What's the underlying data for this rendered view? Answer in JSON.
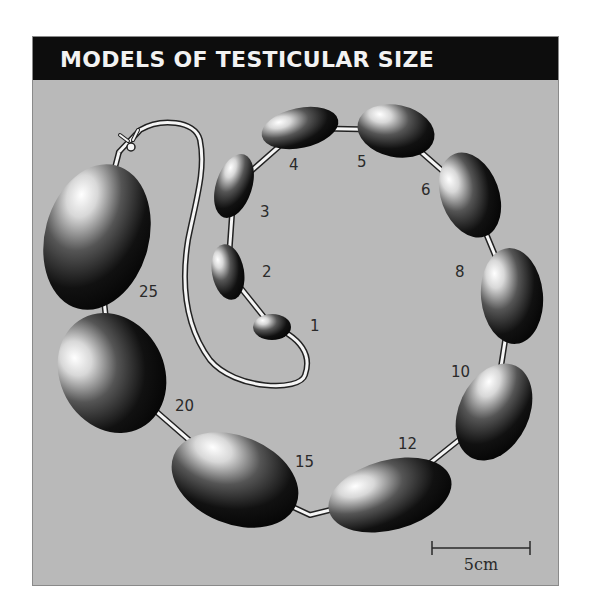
{
  "title": "MODELS OF TESTICULAR SIZE",
  "colors": {
    "background": "#b9b9b9",
    "header": "#0d0d0d",
    "title_text": "#f2f2f2",
    "bead_dark": "#0a0a0a",
    "bead_highlight": "#ffffff",
    "string": "#f5f5f5",
    "label_text": "#2a2a2a"
  },
  "beads": [
    {
      "label": "1",
      "volume_ml": 1
    },
    {
      "label": "2",
      "volume_ml": 2
    },
    {
      "label": "3",
      "volume_ml": 3
    },
    {
      "label": "4",
      "volume_ml": 4
    },
    {
      "label": "5",
      "volume_ml": 5
    },
    {
      "label": "6",
      "volume_ml": 6
    },
    {
      "label": "8",
      "volume_ml": 8
    },
    {
      "label": "10",
      "volume_ml": 10
    },
    {
      "label": "12",
      "volume_ml": 12
    },
    {
      "label": "15",
      "volume_ml": 15
    },
    {
      "label": "20",
      "volume_ml": 20
    },
    {
      "label": "25",
      "volume_ml": 25
    }
  ],
  "scale_bar": {
    "label": "5cm"
  }
}
